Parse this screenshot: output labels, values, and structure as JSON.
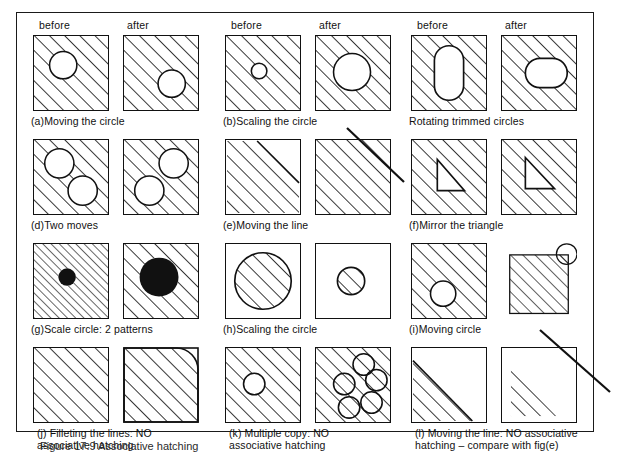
{
  "figure": {
    "caption": "Figure 17.9  Associative hatching",
    "column_headers": {
      "before": "before",
      "after": "after"
    }
  },
  "panels": [
    {
      "id": "a",
      "label": "(a)Moving the circle",
      "row": 0,
      "col": 0,
      "before": "hatched square with circle left-of-centre",
      "after": "hatched square with circle moved to lower right"
    },
    {
      "id": "b",
      "label": "(b)Scaling the circle",
      "row": 0,
      "col": 1,
      "before": "hatched square with small circle",
      "after": "hatched square with enlarged circle"
    },
    {
      "id": "c",
      "label": "Rotating trimmed circles",
      "row": 0,
      "col": 2,
      "before": "hatched square with vertical twin-lobe (peanut) void",
      "after": "hatched square with horizontal twin-lobe (peanut) void"
    },
    {
      "id": "d",
      "label": "(d)Two moves",
      "row": 1,
      "col": 0,
      "before": "hatched square, circle upper-left and circle lower-right",
      "after": "hatched square, circles swapped to upper-right and lower-left"
    },
    {
      "id": "e",
      "label": "(e)Moving the line",
      "row": 1,
      "col": 1,
      "before": "square hatched below a diagonal boundary line",
      "after": "fully hatched square after the line moved"
    },
    {
      "id": "f",
      "label": "(f)Mirror the triangle",
      "row": 1,
      "col": 2,
      "before": "hatched square with right triangle void, vertical edge left",
      "after": "hatched square with mirrored triangle void, vertical edge left-up"
    },
    {
      "id": "g",
      "label": "(g)Scale circle: 2 patterns",
      "row": 2,
      "col": 0,
      "before": "finely hatched square with small solid black circle",
      "after": "coarsely hatched square with large solid black circle"
    },
    {
      "id": "h",
      "label": "(h)Scaling the circle",
      "row": 2,
      "col": 1,
      "before": "plain square containing a large hatched circle",
      "after": "plain square containing a small hatched circle"
    },
    {
      "id": "i",
      "label": "(i)Moving circle",
      "row": 2,
      "col": 2,
      "before": "hatched square with circle low and left of centre",
      "after": "hatched square with circle straddling the top-right corner"
    },
    {
      "id": "j",
      "label": "(j) Filleting the lines: NO\nassociative hatching",
      "row": 3,
      "col": 0,
      "before": "hatched square with square corners",
      "after": "square with filleted top-right corner, hatching unchanged"
    },
    {
      "id": "k",
      "label": "(k) Multiple copy: NO\nassociative hatching",
      "row": 3,
      "col": 1,
      "before": "hatched square with one circle",
      "after": "hatched square with five circles, hatching runs through them"
    },
    {
      "id": "l",
      "label": "(l) Moving the line: NO associative\nhatching – compare with fig(e)",
      "row": 3,
      "col": 2,
      "before": "square with hatched lower-left triangle bounded by a diagonal",
      "after": "square with hatching left floating after the diagonal line moved away"
    }
  ],
  "leaders": [
    {
      "name": "leader-b",
      "x1": 347,
      "y1": 128,
      "x2": 404,
      "y2": 182
    },
    {
      "name": "leader-i",
      "x1": 540,
      "y1": 330,
      "x2": 610,
      "y2": 392
    }
  ],
  "style": {
    "ink": "#111111",
    "paper": "#ffffff",
    "hatch_angle_deg": 45
  }
}
